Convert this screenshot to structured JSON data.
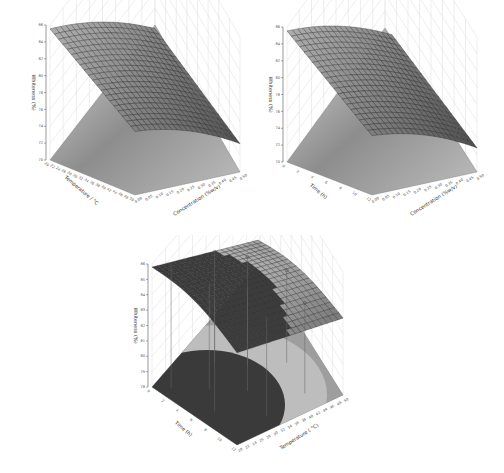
{
  "chart_data": [
    {
      "type": "surface3d",
      "title": "",
      "xlabel": "Temperature / °C",
      "ylabel": "Concentration (%w/v)",
      "zlabel": "Whiteness (%)",
      "zlim": [
        70,
        86
      ],
      "z_ticks": [
        "70",
        "72",
        "74",
        "76",
        "78",
        "80",
        "82",
        "84",
        "86"
      ],
      "x_ticks": [
        "20",
        "22",
        "24",
        "26",
        "28",
        "30",
        "32",
        "34",
        "36",
        "38",
        "40",
        "42",
        "44",
        "46",
        "48",
        "50"
      ],
      "y_ticks": [
        "0.00",
        "0.05",
        "0.10",
        "0.15",
        "0.20",
        "0.25",
        "0.30",
        "0.35",
        "0.40",
        "0.45",
        "0.50"
      ],
      "surface_corners": {
        "front_left": 77.5,
        "back_left": 85.5,
        "back_right": 82.5,
        "front_right": 73.0
      },
      "contour_floor": true
    },
    {
      "type": "surface3d",
      "title": "",
      "xlabel": "Time (h)",
      "ylabel": "Concentration (%w/v)",
      "zlabel": "Whiteness (%)",
      "zlim": [
        70,
        86
      ],
      "z_ticks": [
        "70",
        "72",
        "74",
        "76",
        "78",
        "80",
        "82",
        "84",
        "86"
      ],
      "x_ticks": [
        "0",
        "2",
        "4",
        "6",
        "8",
        "10",
        "12"
      ],
      "y_ticks": [
        "0.00",
        "0.05",
        "0.10",
        "0.15",
        "0.20",
        "0.25",
        "0.30",
        "0.35",
        "0.40",
        "0.45",
        "0.50"
      ],
      "surface_corners": {
        "front_left": 77.0,
        "back_left": 85.5,
        "back_right": 82.0,
        "front_right": 72.5
      },
      "contour_floor": true
    },
    {
      "type": "surface3d",
      "title": "",
      "xlabel": "Time (h)",
      "ylabel": "Temperature ( °C)",
      "zlabel": "Whiteness (%)",
      "zlim": [
        78,
        86
      ],
      "z_ticks": [
        "78",
        "79",
        "80",
        "81",
        "82",
        "83",
        "84",
        "85",
        "86"
      ],
      "x_ticks": [
        "0",
        "2",
        "4",
        "6",
        "8",
        "10",
        "12"
      ],
      "y_ticks": [
        "20",
        "22",
        "24",
        "26",
        "28",
        "30",
        "32",
        "34",
        "36",
        "38",
        "40",
        "42",
        "44",
        "46",
        "48",
        "50"
      ],
      "surface_corners": {
        "front_left": 84.0,
        "back_left": 85.8,
        "back_right": 84.3,
        "front_right": 83.0
      },
      "design_points": 9,
      "contour_floor": true,
      "contour_bands": [
        "#3a3a3a",
        "#bdbdbd",
        "#9e9e9e",
        "#8a8a8a"
      ]
    }
  ],
  "colors": {
    "surface_dark": "#3c3c3c",
    "surface_light": "#9a9a9a",
    "grid": "#dddddd",
    "mesh": "#2a2a2a"
  }
}
